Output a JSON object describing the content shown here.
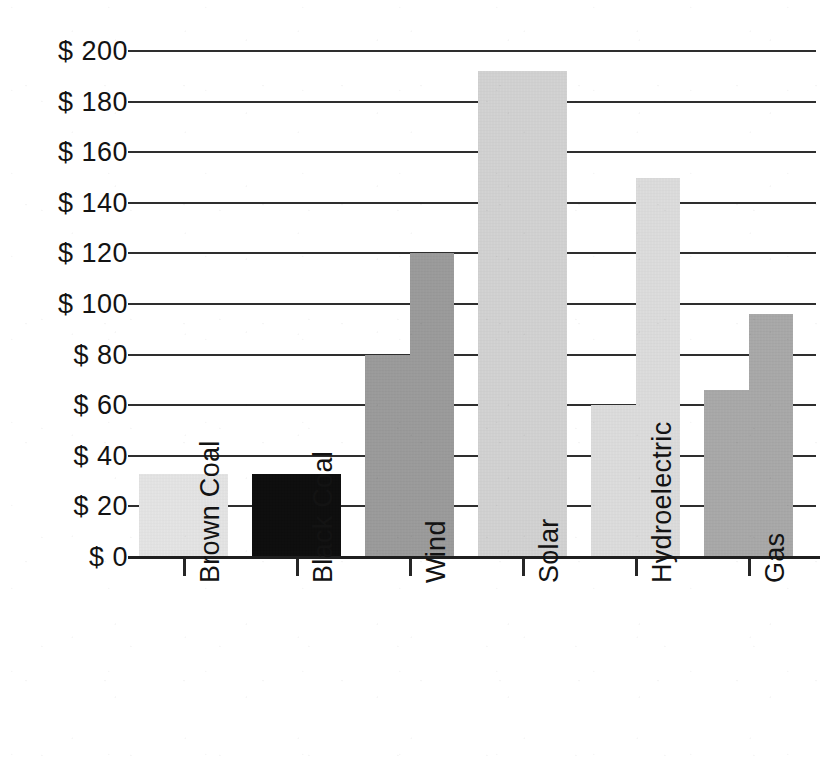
{
  "chart_data": {
    "type": "bar",
    "title": "",
    "subtitle": "",
    "xlabel": "",
    "ylabel": "",
    "currency_prefix": "$",
    "orientation": "vertical",
    "grid": true,
    "legend": null,
    "bar_style": "stepped-range",
    "note": "Each category is drawn as a stepped bar: the left half rises to the low value and the right half rises to the high value. Brown Coal, Black Coal and Solar are flat single-level bars (low = high).",
    "ylim": [
      0,
      200
    ],
    "ytick_step": 20,
    "ytick_labels": [
      "$ 200",
      "$ 180",
      "$ 160",
      "$ 140",
      "$ 120",
      "$ 100",
      "$ 80",
      "$ 60",
      "$ 40",
      "$ 20",
      "$ 0"
    ],
    "ytick_values": [
      200,
      180,
      160,
      140,
      120,
      100,
      80,
      60,
      40,
      20,
      0
    ],
    "categories": [
      "Brown Coal",
      "Black Coal",
      "Wind",
      "Solar",
      "Hydroelectric",
      "Gas"
    ],
    "series": [
      {
        "name": "Low",
        "values": [
          33,
          33,
          80,
          192,
          60,
          66
        ]
      },
      {
        "name": "High",
        "values": [
          33,
          33,
          120,
          192,
          150,
          96
        ]
      }
    ],
    "bars": [
      {
        "category": "Brown Coal",
        "low": 33,
        "high": 33,
        "color": "#e4e4e4"
      },
      {
        "category": "Black Coal",
        "low": 33,
        "high": 33,
        "color": "#0d0d0d"
      },
      {
        "category": "Wind",
        "low": 80,
        "high": 120,
        "color": "#9a9a9a"
      },
      {
        "category": "Solar",
        "low": 192,
        "high": 192,
        "color": "#d2d2d2"
      },
      {
        "category": "Hydroelectric",
        "low": 60,
        "high": 150,
        "color": "#dcdcdc"
      },
      {
        "category": "Gas",
        "low": 66,
        "high": 96,
        "color": "#a8a8a8"
      }
    ],
    "colors": {
      "background": "#ffffff",
      "gridline": "#2e2e2e",
      "axis": "#1f1f1f",
      "text": "#131313"
    }
  }
}
